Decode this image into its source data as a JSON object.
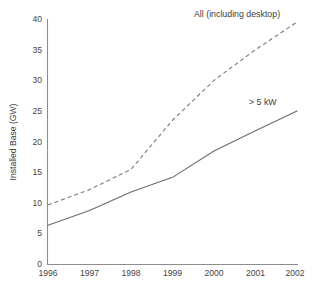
{
  "chart_data": {
    "type": "line",
    "title": "",
    "xlabel": "",
    "ylabel": "Installed Base (GW)",
    "categories": [
      "1996",
      "1997",
      "1998",
      "1999",
      "2000",
      "2001",
      "2002"
    ],
    "x": [
      1996,
      1997,
      1998,
      1999,
      2000,
      2001,
      2002
    ],
    "xlim": [
      1996,
      2002
    ],
    "ylim": [
      0,
      40
    ],
    "grid": false,
    "legend_position": "inline-annotations",
    "y_ticks": [
      "0",
      "5",
      "10",
      "15",
      "20",
      "25",
      "30",
      "35",
      "40"
    ],
    "y_tick_values": [
      0,
      5,
      10,
      15,
      20,
      25,
      30,
      35,
      40
    ],
    "x_ticks": [
      "1996",
      "1997",
      "1998",
      "1999",
      "2000",
      "2001",
      "2002"
    ],
    "series": [
      {
        "name": "All (including desktop)",
        "style": "dashed",
        "color": "#7a7a7a",
        "values": [
          9.7,
          12.2,
          15.5,
          23.5,
          30.0,
          35.0,
          39.5
        ]
      },
      {
        "name": "> 5 kW",
        "style": "solid",
        "color": "#6b6b6b",
        "values": [
          6.4,
          8.8,
          11.8,
          14.2,
          18.5,
          21.8,
          25.0
        ]
      }
    ],
    "annotations": [
      {
        "text": "All (including desktop)",
        "series": "All (including desktop)"
      },
      {
        "text": "> 5 kW",
        "series": "> 5 kW"
      }
    ]
  },
  "axes": {
    "y_axis_title": "Installed Base (GW)",
    "y_tick_labels": [
      "40",
      "35",
      "30",
      "25",
      "20",
      "15",
      "10",
      "5",
      "0"
    ],
    "x_tick_labels": [
      "1996",
      "1997",
      "1998",
      "1999",
      "2000",
      "2001",
      "2002"
    ]
  },
  "annotations": {
    "all_label": "All (including desktop)",
    "kw_label": "> 5 kW"
  },
  "colors": {
    "axis": "#8d8d8d",
    "solid_series": "#6b6b6b",
    "dashed_series": "#7a7a7a",
    "text": "#3d3d3d",
    "background": "#ffffff"
  }
}
